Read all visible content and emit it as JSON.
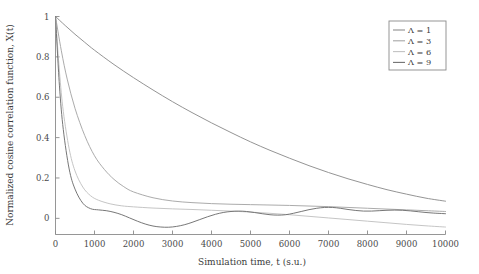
{
  "chart_data": {
    "type": "line",
    "title": "",
    "xlabel": "Simulation time, t (s.u.)",
    "ylabel": "Normalized cosine correlation function, X(t)",
    "xlim": [
      0,
      10000
    ],
    "ylim": [
      -0.08,
      1.0
    ],
    "grid": false,
    "legend_position": "top-right",
    "xticks": [
      0,
      1000,
      2000,
      3000,
      4000,
      5000,
      6000,
      7000,
      8000,
      9000,
      10000
    ],
    "xticklabels": [
      "0",
      "1000",
      "2000",
      "3000",
      "4000",
      "5000",
      "6000",
      "7000",
      "8000",
      "9000",
      "10000"
    ],
    "yticks": [
      0,
      0.2,
      0.4,
      0.6,
      0.8,
      1
    ],
    "yticklabels": [
      "0",
      "0.2",
      "0.4",
      "0.6",
      "0.8",
      "1"
    ],
    "series": [
      {
        "name": "Λ = 1",
        "color": "#8e8e8e",
        "x": [
          0,
          250,
          500,
          750,
          1000,
          1500,
          2000,
          2500,
          3000,
          3500,
          4000,
          4500,
          5000,
          5500,
          6000,
          6500,
          7000,
          7500,
          8000,
          8500,
          9000,
          9500,
          10000
        ],
        "y": [
          1.0,
          0.955,
          0.912,
          0.872,
          0.833,
          0.762,
          0.697,
          0.636,
          0.578,
          0.524,
          0.473,
          0.425,
          0.379,
          0.337,
          0.298,
          0.261,
          0.227,
          0.196,
          0.168,
          0.142,
          0.12,
          0.1,
          0.085
        ]
      },
      {
        "name": "Λ = 3",
        "color": "#a6a6a6",
        "x": [
          0,
          150,
          300,
          500,
          750,
          1000,
          1250,
          1500,
          1750,
          2000,
          2500,
          3000,
          3500,
          4000,
          4500,
          5000,
          5500,
          6000,
          6500,
          7000,
          7500,
          8000,
          8500,
          9000,
          9500,
          10000
        ],
        "y": [
          1.0,
          0.83,
          0.69,
          0.545,
          0.41,
          0.31,
          0.243,
          0.193,
          0.157,
          0.131,
          0.102,
          0.086,
          0.078,
          0.073,
          0.07,
          0.068,
          0.066,
          0.064,
          0.061,
          0.058,
          0.054,
          0.05,
          0.046,
          0.042,
          0.038,
          0.034
        ]
      },
      {
        "name": "Λ = 6",
        "color": "#c2c2c2",
        "x": [
          0,
          100,
          200,
          350,
          500,
          700,
          900,
          1100,
          1400,
          1700,
          2000,
          2500,
          3000,
          3500,
          4000,
          4500,
          5000,
          5500,
          6000,
          6500,
          7000,
          7500,
          8000,
          8500,
          9000,
          9500,
          10000
        ],
        "y": [
          1.0,
          0.73,
          0.53,
          0.345,
          0.235,
          0.155,
          0.112,
          0.09,
          0.072,
          0.062,
          0.057,
          0.051,
          0.047,
          0.044,
          0.04,
          0.036,
          0.031,
          0.025,
          0.018,
          0.01,
          0.002,
          -0.006,
          -0.014,
          -0.022,
          -0.03,
          -0.037,
          -0.043
        ]
      },
      {
        "name": "Λ = 9",
        "color": "#707070",
        "x": [
          0,
          100,
          200,
          350,
          500,
          700,
          900,
          1100,
          1300,
          1500,
          1700,
          1900,
          2100,
          2300,
          2500,
          2700,
          2900,
          3100,
          3300,
          3500,
          3700,
          3900,
          4100,
          4300,
          4500,
          4700,
          4900,
          5100,
          5300,
          5500,
          5700,
          5900,
          6100,
          6300,
          6500,
          6700,
          6900,
          7100,
          7300,
          7500,
          7700,
          7900,
          8100,
          8300,
          8500,
          8700,
          8900,
          9100,
          9300,
          9500,
          9700,
          9900,
          10000
        ],
        "y": [
          1.0,
          0.66,
          0.44,
          0.245,
          0.145,
          0.075,
          0.048,
          0.042,
          0.038,
          0.03,
          0.018,
          0.002,
          -0.014,
          -0.028,
          -0.038,
          -0.043,
          -0.044,
          -0.04,
          -0.032,
          -0.02,
          -0.006,
          0.008,
          0.02,
          0.029,
          0.034,
          0.036,
          0.034,
          0.029,
          0.023,
          0.018,
          0.016,
          0.018,
          0.025,
          0.034,
          0.043,
          0.05,
          0.054,
          0.054,
          0.05,
          0.044,
          0.039,
          0.036,
          0.036,
          0.038,
          0.04,
          0.041,
          0.04,
          0.037,
          0.033,
          0.029,
          0.026,
          0.024,
          0.023
        ]
      }
    ]
  },
  "legend": {
    "entries": [
      "Λ = 1",
      "Λ = 3",
      "Λ = 6",
      "Λ = 9"
    ]
  },
  "axes": {
    "x_label": "Simulation time, t (s.u.)",
    "y_label": "Normalized cosine correlation function, X(t)"
  },
  "colors": {
    "axis": "#8a8a8a",
    "text": "#3c3c3c",
    "background": "#ffffff"
  }
}
